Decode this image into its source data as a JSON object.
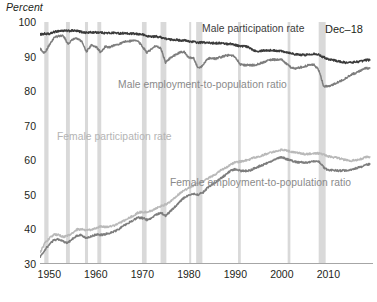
{
  "chart_data": {
    "type": "line",
    "title": "",
    "subtitle": "",
    "ylabel": "Percent",
    "xlabel": "",
    "ylim": [
      30,
      100
    ],
    "xlim": [
      1948.0,
      2019.6
    ],
    "grid": false,
    "legend_position": "inline-annotations",
    "y_ticks": [
      100,
      90,
      80,
      70,
      60,
      50,
      40,
      30
    ],
    "x_ticks": [
      1950,
      1960,
      1970,
      1980,
      1990,
      2000,
      2010
    ],
    "annotations": [
      {
        "text": "Male participation rate",
        "color": "#3b3b3b"
      },
      {
        "text": "Male employment-to-population ratio",
        "color": "#8a8a8a"
      },
      {
        "text": "Female participation rate",
        "color": "#b4b4b4"
      },
      {
        "text": "Female employment-to-population ratio",
        "color": "#8a8a8a"
      },
      {
        "text": "Dec–18",
        "color": "#231f20"
      }
    ],
    "recession_bands": [
      [
        1948.92,
        1949.83
      ],
      [
        1953.58,
        1954.42
      ],
      [
        1957.67,
        1958.33
      ],
      [
        1960.33,
        1961.17
      ],
      [
        1969.92,
        1970.92
      ],
      [
        1973.92,
        1975.17
      ],
      [
        1980.08,
        1980.5
      ],
      [
        1981.58,
        1982.92
      ],
      [
        1990.58,
        1991.17
      ],
      [
        2001.25,
        2001.83
      ],
      [
        2007.92,
        2009.42
      ]
    ],
    "series": [
      {
        "name": "Male participation rate",
        "color": "#3b3b3b",
        "x": [
          1948,
          1949,
          1950,
          1951,
          1952,
          1953,
          1954,
          1955,
          1956,
          1957,
          1958,
          1959,
          1960,
          1961,
          1962,
          1963,
          1964,
          1965,
          1966,
          1967,
          1968,
          1969,
          1970,
          1971,
          1972,
          1973,
          1974,
          1975,
          1976,
          1977,
          1978,
          1979,
          1980,
          1981,
          1982,
          1983,
          1984,
          1985,
          1986,
          1987,
          1988,
          1989,
          1990,
          1991,
          1992,
          1993,
          1994,
          1995,
          1996,
          1997,
          1998,
          1999,
          2000,
          2001,
          2002,
          2003,
          2004,
          2005,
          2006,
          2007,
          2008,
          2009,
          2010,
          2011,
          2012,
          2013,
          2014,
          2015,
          2016,
          2017,
          2018,
          2018.92
        ],
        "values": [
          96.4,
          96.6,
          96.5,
          97.1,
          97.4,
          97.5,
          97.4,
          97.5,
          97.4,
          97.1,
          96.9,
          97.0,
          97.0,
          97.0,
          96.8,
          96.8,
          96.9,
          96.7,
          96.8,
          96.6,
          96.6,
          96.5,
          96.4,
          95.9,
          95.8,
          95.8,
          95.6,
          95.2,
          94.9,
          94.9,
          94.7,
          94.7,
          94.4,
          94.3,
          94.0,
          94.1,
          94.0,
          93.9,
          93.9,
          93.9,
          93.7,
          93.7,
          93.4,
          93.0,
          93.0,
          92.6,
          91.8,
          91.6,
          91.8,
          91.8,
          91.8,
          91.7,
          91.6,
          91.3,
          91.0,
          90.6,
          90.5,
          90.5,
          90.6,
          90.9,
          90.5,
          89.8,
          89.3,
          89.0,
          88.7,
          88.4,
          88.2,
          88.3,
          88.5,
          88.6,
          89.0,
          89.0
        ]
      },
      {
        "name": "Male employment-to-population ratio",
        "color": "#7d7d7d",
        "x": [
          1948,
          1949,
          1950,
          1951,
          1952,
          1953,
          1954,
          1955,
          1956,
          1957,
          1958,
          1959,
          1960,
          1961,
          1962,
          1963,
          1964,
          1965,
          1966,
          1967,
          1968,
          1969,
          1970,
          1971,
          1972,
          1973,
          1974,
          1975,
          1976,
          1977,
          1978,
          1979,
          1980,
          1981,
          1982,
          1983,
          1984,
          1985,
          1986,
          1987,
          1988,
          1989,
          1990,
          1991,
          1992,
          1993,
          1994,
          1995,
          1996,
          1997,
          1998,
          1999,
          2000,
          2001,
          2002,
          2003,
          2004,
          2005,
          2006,
          2007,
          2008,
          2009,
          2010,
          2011,
          2012,
          2013,
          2014,
          2015,
          2016,
          2017,
          2018,
          2018.92
        ],
        "values": [
          92.4,
          90.9,
          93.4,
          95.4,
          95.9,
          96.1,
          93.6,
          95.0,
          95.2,
          94.3,
          91.4,
          93.3,
          92.9,
          91.3,
          92.8,
          92.8,
          93.3,
          93.6,
          94.3,
          94.4,
          94.5,
          94.7,
          92.9,
          91.2,
          92.2,
          93.2,
          92.3,
          88.3,
          89.6,
          90.4,
          91.2,
          91.3,
          89.7,
          89.6,
          86.6,
          87.3,
          89.5,
          89.5,
          89.4,
          89.9,
          90.3,
          90.4,
          89.9,
          87.8,
          87.5,
          87.6,
          87.5,
          87.9,
          88.3,
          88.9,
          89.1,
          89.1,
          89.1,
          87.9,
          86.8,
          86.5,
          86.9,
          87.2,
          87.6,
          87.6,
          85.9,
          81.4,
          81.4,
          81.9,
          82.5,
          83.2,
          84.0,
          84.8,
          85.3,
          86.0,
          86.6,
          86.7
        ]
      },
      {
        "name": "Female participation rate",
        "color": "#b9b9b9",
        "x": [
          1948,
          1949,
          1950,
          1951,
          1952,
          1953,
          1954,
          1955,
          1956,
          1957,
          1958,
          1959,
          1960,
          1961,
          1962,
          1963,
          1964,
          1965,
          1966,
          1967,
          1968,
          1969,
          1970,
          1971,
          1972,
          1973,
          1974,
          1975,
          1976,
          1977,
          1978,
          1979,
          1980,
          1981,
          1982,
          1983,
          1984,
          1985,
          1986,
          1987,
          1988,
          1989,
          1990,
          1991,
          1992,
          1993,
          1994,
          1995,
          1996,
          1997,
          1998,
          1999,
          2000,
          2001,
          2002,
          2003,
          2004,
          2005,
          2006,
          2007,
          2008,
          2009,
          2010,
          2011,
          2012,
          2013,
          2014,
          2015,
          2016,
          2017,
          2018,
          2018.92
        ],
        "values": [
          33.2,
          36.0,
          37.4,
          38.5,
          38.4,
          37.8,
          38.2,
          38.9,
          40.0,
          40.0,
          39.8,
          39.9,
          40.4,
          40.9,
          40.7,
          40.9,
          41.2,
          41.8,
          42.5,
          43.2,
          43.9,
          44.8,
          45.1,
          45.0,
          45.4,
          46.1,
          46.8,
          47.2,
          48.0,
          49.1,
          50.4,
          51.3,
          52.0,
          52.7,
          53.4,
          53.8,
          54.7,
          55.4,
          56.2,
          57.2,
          57.9,
          58.8,
          59.4,
          59.6,
          59.9,
          60.1,
          60.8,
          61.1,
          61.5,
          62.0,
          62.3,
          62.8,
          63.0,
          62.8,
          62.5,
          62.3,
          62.0,
          61.8,
          61.9,
          62.0,
          62.0,
          61.6,
          61.1,
          60.9,
          60.7,
          60.3,
          60.0,
          59.9,
          60.1,
          60.4,
          60.9,
          61.0
        ]
      },
      {
        "name": "Female employment-to-population ratio",
        "color": "#7d7d7d",
        "x": [
          1948,
          1949,
          1950,
          1951,
          1952,
          1953,
          1954,
          1955,
          1956,
          1957,
          1958,
          1959,
          1960,
          1961,
          1962,
          1963,
          1964,
          1965,
          1966,
          1967,
          1968,
          1969,
          1970,
          1971,
          1972,
          1973,
          1974,
          1975,
          1976,
          1977,
          1978,
          1979,
          1980,
          1981,
          1982,
          1983,
          1984,
          1985,
          1986,
          1987,
          1988,
          1989,
          1990,
          1991,
          1992,
          1993,
          1994,
          1995,
          1996,
          1997,
          1998,
          1999,
          2000,
          2001,
          2002,
          2003,
          2004,
          2005,
          2006,
          2007,
          2008,
          2009,
          2010,
          2011,
          2012,
          2013,
          2014,
          2015,
          2016,
          2017,
          2018,
          2018.92
        ],
        "values": [
          32.0,
          34.0,
          35.6,
          37.0,
          37.1,
          36.5,
          36.1,
          37.3,
          38.3,
          38.3,
          37.4,
          38.0,
          38.5,
          38.4,
          38.6,
          38.9,
          39.4,
          40.1,
          41.2,
          41.9,
          42.6,
          43.5,
          43.3,
          42.8,
          43.3,
          44.3,
          44.8,
          44.0,
          45.2,
          46.5,
          48.0,
          49.2,
          49.8,
          50.2,
          50.1,
          50.6,
          52.0,
          53.0,
          53.9,
          54.9,
          55.9,
          57.0,
          57.4,
          57.0,
          56.9,
          57.0,
          57.6,
          58.2,
          58.7,
          59.4,
          59.8,
          60.5,
          60.9,
          60.4,
          59.9,
          59.5,
          59.4,
          59.3,
          59.5,
          59.7,
          59.6,
          57.9,
          57.1,
          57.1,
          57.0,
          57.0,
          57.1,
          57.2,
          57.7,
          58.1,
          58.7,
          58.9
        ]
      }
    ]
  },
  "axis": {
    "unit_label": "Percent"
  },
  "labels": {
    "male_participation": "Male participation rate",
    "male_epop": "Male employment-to-population ratio",
    "female_participation": "Female participation rate",
    "female_epop": "Female employment-to-population ratio",
    "date_stamp": "Dec–18"
  },
  "colors": {
    "male_participation": "#3b3b3b",
    "male_epop": "#7d7d7d",
    "female_participation": "#b9b9b9",
    "female_epop": "#7d7d7d",
    "recession_band": "#d9d9d9",
    "axis": "#a6a6a6",
    "text": "#231f20"
  }
}
